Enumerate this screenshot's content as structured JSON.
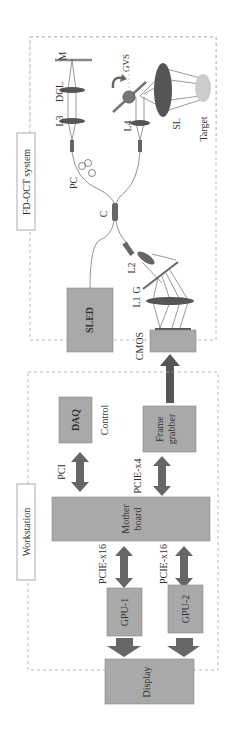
{
  "diagram": {
    "orientation": "rotated-90-ccw",
    "colors": {
      "box_fill": "#a9a9a9",
      "box_stroke": "#888888",
      "arrow": "#666666",
      "dashed_border": "#aaaaaa",
      "lens": "#555555",
      "target": "#c8c8c8"
    },
    "fdoct": {
      "title": "FD-OCT system",
      "components": {
        "sled": "SLED",
        "coupler": "C",
        "polarization_controller": "PC",
        "l3": "L3",
        "dcl": "DCL",
        "mirror": "M",
        "l4": "L4",
        "gvs": "GVS",
        "scan_lens": "SL",
        "target": "Target",
        "l2": "L2",
        "grating": "G",
        "l1": "L1",
        "cmos": "CMOS"
      }
    },
    "workstation": {
      "title": "Workstation",
      "boxes": {
        "daq": "DAQ",
        "frame_grabber_line1": "Frame",
        "frame_grabber_line2": "grabber",
        "motherboard_line1": "Mother",
        "motherboard_line2": "board",
        "gpu1": "GPU-1",
        "gpu2": "GPU-2",
        "display": "Display"
      },
      "links": {
        "control": "Control",
        "pci": "PCI",
        "pcie_x4": "PCIE-x4",
        "pcie_x16_1": "PCIE-x16",
        "pcie_x16_2": "PCIE-x16"
      }
    }
  }
}
